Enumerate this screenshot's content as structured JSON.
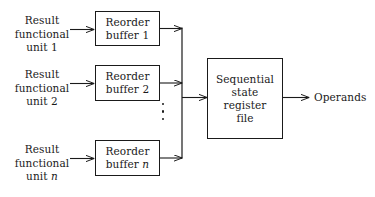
{
  "diagram": {
    "background_color": "#ffffff",
    "line_color": "#1a1a1a",
    "sources": [
      {
        "line1": "Result",
        "line2": "functional",
        "line3": "unit",
        "index": "1"
      },
      {
        "line1": "Result",
        "line2": "functional",
        "line3": "unit",
        "index": "2"
      },
      {
        "line1": "Result",
        "line2": "functional",
        "line3": "unit",
        "index": "n"
      }
    ],
    "buffers": [
      {
        "line1": "Reorder",
        "line2": "buffer",
        "index": "1"
      },
      {
        "line1": "Reorder",
        "line2": "buffer",
        "index": "2"
      },
      {
        "line1": "Reorder",
        "line2": "buffer",
        "index": "n"
      }
    ],
    "register_file": {
      "line1": "Sequential",
      "line2": "state",
      "line3": "register",
      "line4": "file"
    },
    "output": {
      "label": "Operands"
    },
    "ellipsis": {
      "name": "vertical-ellipsis",
      "dot_count": 3
    }
  }
}
